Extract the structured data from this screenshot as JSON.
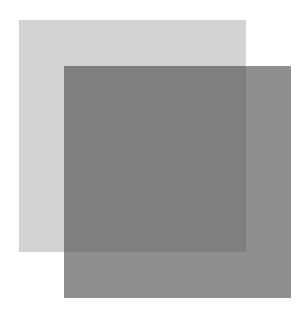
{
  "canvas": {
    "width": 306,
    "height": 317,
    "background": "#ffffff"
  },
  "shapes": [
    {
      "name": "light-square",
      "color": "#d3d3d3",
      "x": 19,
      "y": 20,
      "width": 227,
      "height": 232
    },
    {
      "name": "dark-square",
      "color": "#8a8a8a",
      "overlap_color": "#717171",
      "x": 64,
      "y": 66,
      "width": 227,
      "height": 232,
      "opacity": "semi-transparent"
    }
  ]
}
